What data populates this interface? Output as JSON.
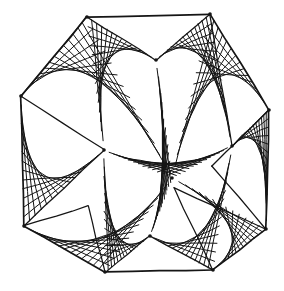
{
  "artwork": {
    "title": "Curve Stitching Star Polygon",
    "style": "hand-drawn ink line figure",
    "background_color": "#ffffff",
    "ink_color": "#151515",
    "canvas": {
      "width": 284,
      "height": 291
    },
    "stroke": {
      "outline_width": 1.7,
      "thread_width": 1.0,
      "jitter": 0.9
    }
  },
  "chart_data": {
    "type": "line",
    "xlabel": "",
    "ylabel": "",
    "xlim": [
      0,
      284
    ],
    "ylim": [
      0,
      291
    ],
    "grid": false,
    "legend": "none",
    "outer_vertices": [
      {
        "name": "top-left-apex",
        "x": 87,
        "y": 17
      },
      {
        "name": "top-right-apex",
        "x": 210,
        "y": 14
      },
      {
        "name": "right-upper",
        "x": 269,
        "y": 110
      },
      {
        "name": "right-lower",
        "x": 266,
        "y": 229
      },
      {
        "name": "bottom-right-apex",
        "x": 213,
        "y": 270
      },
      {
        "name": "bottom-left-apex",
        "x": 105,
        "y": 272
      },
      {
        "name": "left-lower",
        "x": 24,
        "y": 226
      },
      {
        "name": "left-upper",
        "x": 21,
        "y": 96
      }
    ],
    "inner_nodes": [
      {
        "name": "upper-center-node",
        "x": 156,
        "y": 60
      },
      {
        "name": "center-node",
        "x": 172,
        "y": 178
      },
      {
        "name": "mid-left-node",
        "x": 104,
        "y": 150
      },
      {
        "name": "mid-right-node",
        "x": 232,
        "y": 146
      },
      {
        "name": "lower-center-node",
        "x": 150,
        "y": 236
      }
    ],
    "thread_families": [
      {
        "name": "family-tl-left",
        "from": "top-left-apex",
        "to": "left-upper",
        "threads": 14
      },
      {
        "name": "family-tl-center",
        "from": "top-left-apex",
        "to": "center-node",
        "threads": 14
      },
      {
        "name": "family-tr-right",
        "from": "top-right-apex",
        "to": "right-upper",
        "threads": 14
      },
      {
        "name": "family-tr-center",
        "from": "top-right-apex",
        "to": "center-node",
        "threads": 14
      },
      {
        "name": "family-rl-bot",
        "from": "right-lower",
        "to": "bottom-right-apex",
        "threads": 14
      },
      {
        "name": "family-bl-left",
        "from": "bottom-left-apex",
        "to": "left-lower",
        "threads": 14
      },
      {
        "name": "family-left-mid",
        "from": "left-upper",
        "to": "mid-left-node",
        "threads": 14
      },
      {
        "name": "family-right-mid",
        "from": "right-upper",
        "to": "mid-right-node",
        "threads": 14
      }
    ],
    "series": [
      {
        "name": "outer-octagon",
        "closed": true,
        "x": [
          87,
          210,
          269,
          266,
          213,
          105,
          24,
          21
        ],
        "y": [
          17,
          14,
          110,
          229,
          270,
          272,
          226,
          96
        ]
      },
      {
        "name": "star-envelope-hull",
        "closed": true,
        "x": [
          87,
          156,
          210,
          232,
          269,
          212,
          266,
          174,
          213,
          150,
          105,
          88,
          24,
          104,
          21
        ],
        "y": [
          17,
          60,
          14,
          146,
          110,
          166,
          229,
          188,
          270,
          236,
          272,
          206,
          226,
          150,
          96
        ]
      }
    ]
  }
}
